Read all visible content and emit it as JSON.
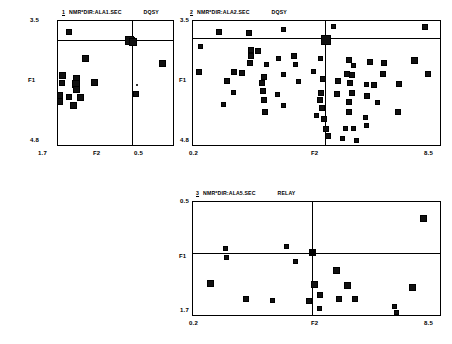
{
  "panels": [
    {
      "id": "panel-1",
      "number": "1",
      "file_label": "NMR*DIR:ALA1.SEC",
      "mode": "DQSY",
      "xlabel": "F2",
      "ylabel": "F1",
      "x_left_tick": "1.7",
      "x_right_tick": "0.5",
      "y_top_tick": "3.5",
      "y_bottom_tick": "4.8"
    },
    {
      "id": "panel-2",
      "number": "2",
      "file_label": "NMR*DIR:ALA2.SEC",
      "mode": "DQSY",
      "xlabel": "F2",
      "ylabel": "F1",
      "x_left_tick": "0.2",
      "x_right_tick": "8.5",
      "y_top_tick": "3.5",
      "y_bottom_tick": "4.8"
    },
    {
      "id": "panel-3",
      "number": "3",
      "file_label": "NMR*DIR:ALA5.SEC",
      "mode": "RELAY",
      "xlabel": "F2",
      "ylabel": "F1",
      "x_left_tick": "0.2",
      "x_right_tick": "8.5",
      "y_top_tick": "0.5",
      "y_bottom_tick": "1.7"
    }
  ],
  "colors": {
    "peak": "#111111",
    "axis": "#000000",
    "background": "#ffffff"
  },
  "chart_data": [
    {
      "type": "scatter",
      "title": "NMR*DIR:ALA1.SEC DQSY",
      "xlabel": "F2",
      "ylabel": "F1",
      "xlim": [
        1.7,
        0.5
      ],
      "ylim": [
        3.5,
        4.8
      ],
      "grid": false,
      "legend": "none",
      "cursor": {
        "x": 0.93,
        "y": 3.7
      },
      "points": [
        {
          "x": 1.6,
          "y": 3.6,
          "s": 4
        },
        {
          "x": 0.96,
          "y": 3.69,
          "s": 7
        },
        {
          "x": 0.93,
          "y": 3.71,
          "s": 6
        },
        {
          "x": 1.42,
          "y": 3.88,
          "s": 5
        },
        {
          "x": 0.62,
          "y": 3.93,
          "s": 5
        },
        {
          "x": 1.66,
          "y": 4.06,
          "s": 5
        },
        {
          "x": 1.52,
          "y": 4.09,
          "s": 5
        },
        {
          "x": 1.67,
          "y": 4.14,
          "s": 4
        },
        {
          "x": 1.52,
          "y": 4.15,
          "s": 6
        },
        {
          "x": 1.33,
          "y": 4.13,
          "s": 5
        },
        {
          "x": 1.52,
          "y": 4.21,
          "s": 5
        },
        {
          "x": 1.7,
          "y": 4.27,
          "s": 5
        },
        {
          "x": 1.6,
          "y": 4.29,
          "s": 4
        },
        {
          "x": 1.48,
          "y": 4.29,
          "s": 5
        },
        {
          "x": 1.69,
          "y": 4.33,
          "s": 5
        },
        {
          "x": 1.55,
          "y": 4.38,
          "s": 5
        },
        {
          "x": 0.9,
          "y": 4.26,
          "s": 4
        },
        {
          "x": 0.88,
          "y": 4.17,
          "s": 2
        }
      ]
    },
    {
      "type": "scatter",
      "title": "NMR*DIR:ALA2.SEC DQSY",
      "xlabel": "F2",
      "ylabel": "F1",
      "xlim": [
        0.2,
        8.5
      ],
      "ylim": [
        3.5,
        4.8
      ],
      "grid": false,
      "legend": "none",
      "cursor": {
        "x": 4.65,
        "y": 3.68
      },
      "points": [
        {
          "x": 1.05,
          "y": 3.6,
          "s": 4
        },
        {
          "x": 2.05,
          "y": 3.62,
          "s": 4
        },
        {
          "x": 3.2,
          "y": 3.58,
          "s": 3
        },
        {
          "x": 4.62,
          "y": 3.69,
          "s": 8
        },
        {
          "x": 0.42,
          "y": 3.76,
          "s": 3
        },
        {
          "x": 2.12,
          "y": 3.79,
          "s": 4
        },
        {
          "x": 2.35,
          "y": 3.8,
          "s": 4
        },
        {
          "x": 2.1,
          "y": 3.86,
          "s": 4
        },
        {
          "x": 3.05,
          "y": 3.88,
          "s": 3
        },
        {
          "x": 3.55,
          "y": 3.86,
          "s": 4
        },
        {
          "x": 4.45,
          "y": 3.88,
          "s": 3
        },
        {
          "x": 2.08,
          "y": 3.93,
          "s": 4
        },
        {
          "x": 2.65,
          "y": 3.95,
          "s": 3
        },
        {
          "x": 3.6,
          "y": 3.95,
          "s": 3
        },
        {
          "x": 0.38,
          "y": 4.02,
          "s": 4
        },
        {
          "x": 1.55,
          "y": 4.02,
          "s": 4
        },
        {
          "x": 1.8,
          "y": 4.03,
          "s": 4
        },
        {
          "x": 3.2,
          "y": 4.05,
          "s": 3
        },
        {
          "x": 4.2,
          "y": 4.02,
          "s": 3
        },
        {
          "x": 2.55,
          "y": 4.08,
          "s": 4
        },
        {
          "x": 1.3,
          "y": 4.12,
          "s": 4
        },
        {
          "x": 2.48,
          "y": 4.14,
          "s": 4
        },
        {
          "x": 3.7,
          "y": 4.12,
          "s": 3
        },
        {
          "x": 4.55,
          "y": 4.1,
          "s": 4
        },
        {
          "x": 2.52,
          "y": 4.22,
          "s": 4
        },
        {
          "x": 1.52,
          "y": 4.24,
          "s": 3
        },
        {
          "x": 3.0,
          "y": 4.26,
          "s": 3
        },
        {
          "x": 4.48,
          "y": 4.24,
          "s": 4
        },
        {
          "x": 2.55,
          "y": 4.32,
          "s": 4
        },
        {
          "x": 4.42,
          "y": 4.32,
          "s": 4
        },
        {
          "x": 1.2,
          "y": 4.36,
          "s": 3
        },
        {
          "x": 3.2,
          "y": 4.38,
          "s": 3
        },
        {
          "x": 4.5,
          "y": 4.4,
          "s": 4
        },
        {
          "x": 2.6,
          "y": 4.44,
          "s": 4
        },
        {
          "x": 4.3,
          "y": 4.48,
          "s": 3
        },
        {
          "x": 4.58,
          "y": 4.52,
          "s": 4
        },
        {
          "x": 4.62,
          "y": 4.62,
          "s": 4
        },
        {
          "x": 4.7,
          "y": 4.7,
          "s": 4
        },
        {
          "x": 5.4,
          "y": 3.9,
          "s": 4
        },
        {
          "x": 5.55,
          "y": 3.96,
          "s": 3
        },
        {
          "x": 6.1,
          "y": 3.92,
          "s": 4
        },
        {
          "x": 6.6,
          "y": 3.93,
          "s": 4
        },
        {
          "x": 7.6,
          "y": 3.9,
          "s": 5
        },
        {
          "x": 5.35,
          "y": 4.05,
          "s": 4
        },
        {
          "x": 5.5,
          "y": 4.06,
          "s": 4
        },
        {
          "x": 6.55,
          "y": 4.05,
          "s": 4
        },
        {
          "x": 5.05,
          "y": 4.12,
          "s": 4
        },
        {
          "x": 5.45,
          "y": 4.14,
          "s": 4
        },
        {
          "x": 6.0,
          "y": 4.16,
          "s": 3
        },
        {
          "x": 6.25,
          "y": 4.16,
          "s": 4
        },
        {
          "x": 7.1,
          "y": 4.15,
          "s": 4
        },
        {
          "x": 5.5,
          "y": 4.24,
          "s": 4
        },
        {
          "x": 5.0,
          "y": 4.26,
          "s": 4
        },
        {
          "x": 6.0,
          "y": 4.28,
          "s": 4
        },
        {
          "x": 5.42,
          "y": 4.34,
          "s": 4
        },
        {
          "x": 6.35,
          "y": 4.34,
          "s": 3
        },
        {
          "x": 5.4,
          "y": 4.44,
          "s": 4
        },
        {
          "x": 7.05,
          "y": 4.44,
          "s": 4
        },
        {
          "x": 5.95,
          "y": 4.5,
          "s": 3
        },
        {
          "x": 5.98,
          "y": 4.58,
          "s": 3
        },
        {
          "x": 5.3,
          "y": 4.62,
          "s": 3
        },
        {
          "x": 5.55,
          "y": 4.62,
          "s": 3
        },
        {
          "x": 4.9,
          "y": 3.55,
          "s": 3
        },
        {
          "x": 7.95,
          "y": 3.55,
          "s": 4
        },
        {
          "x": 8.05,
          "y": 4.04,
          "s": 4
        },
        {
          "x": 5.2,
          "y": 4.72,
          "s": 3
        },
        {
          "x": 5.65,
          "y": 4.74,
          "s": 3
        }
      ]
    },
    {
      "type": "scatter",
      "title": "NMR*DIR:ALA5.SEC RELAY",
      "xlabel": "F2",
      "ylabel": "F1",
      "xlim": [
        0.2,
        8.5
      ],
      "ylim": [
        0.5,
        1.7
      ],
      "grid": false,
      "legend": "none",
      "cursor": {
        "x": 4.2,
        "y": 1.04
      },
      "points": [
        {
          "x": 7.9,
          "y": 0.66,
          "s": 5
        },
        {
          "x": 1.25,
          "y": 0.98,
          "s": 3
        },
        {
          "x": 3.3,
          "y": 0.96,
          "s": 3
        },
        {
          "x": 1.28,
          "y": 1.08,
          "s": 3
        },
        {
          "x": 3.6,
          "y": 1.12,
          "s": 3
        },
        {
          "x": 5.0,
          "y": 1.22,
          "s": 5
        },
        {
          "x": 0.75,
          "y": 1.36,
          "s": 5
        },
        {
          "x": 4.25,
          "y": 1.37,
          "s": 5
        },
        {
          "x": 5.35,
          "y": 1.38,
          "s": 5
        },
        {
          "x": 7.55,
          "y": 1.4,
          "s": 5
        },
        {
          "x": 4.45,
          "y": 1.48,
          "s": 4
        },
        {
          "x": 1.95,
          "y": 1.52,
          "s": 4
        },
        {
          "x": 2.85,
          "y": 1.54,
          "s": 3
        },
        {
          "x": 4.05,
          "y": 1.54,
          "s": 4
        },
        {
          "x": 5.08,
          "y": 1.52,
          "s": 4
        },
        {
          "x": 5.62,
          "y": 1.52,
          "s": 4
        },
        {
          "x": 4.42,
          "y": 1.62,
          "s": 3
        },
        {
          "x": 6.95,
          "y": 1.6,
          "s": 3
        },
        {
          "x": 7.0,
          "y": 1.66,
          "s": 3
        }
      ]
    }
  ]
}
